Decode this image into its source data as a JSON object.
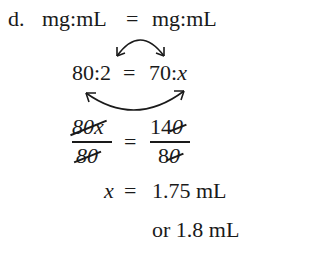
{
  "problem": {
    "label": "d.",
    "line1": {
      "left": "mg:mL",
      "eq": "=",
      "right": "mg:mL"
    },
    "line2": {
      "left": "80:2",
      "eq": "=",
      "right_num": "70:",
      "right_var": "x"
    },
    "fraction": {
      "left_num_coef": "80",
      "left_num_var": "x",
      "left_den": "80",
      "eq": "=",
      "right_num_keep": "14",
      "right_num_struck": "0",
      "right_den_keep": "8",
      "right_den_struck": "0"
    },
    "result": {
      "var": "x",
      "eq": "=",
      "value": "1.75 mL"
    },
    "rounded": "or 1.8 mL"
  },
  "colors": {
    "ink": "#1a1a1a",
    "background": "#ffffff"
  }
}
